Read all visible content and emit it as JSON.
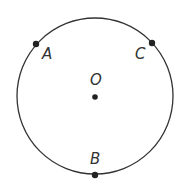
{
  "diagram": {
    "type": "circle-with-points",
    "circle": {
      "cx": 95,
      "cy": 96,
      "r": 78,
      "stroke": "#333333"
    },
    "center": {
      "id": "O",
      "label": "O",
      "x": 95,
      "y": 97
    },
    "points": [
      {
        "id": "A",
        "label": "A",
        "x": 36,
        "y": 44
      },
      {
        "id": "C",
        "label": "C",
        "x": 152,
        "y": 43
      },
      {
        "id": "B",
        "label": "B",
        "x": 95,
        "y": 175
      }
    ]
  }
}
